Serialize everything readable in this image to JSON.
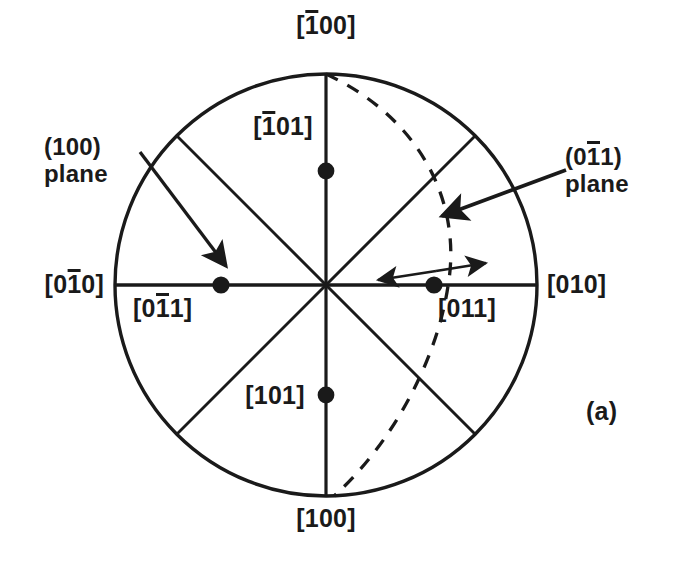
{
  "figure": {
    "kind": "stereographic-projection",
    "panel_label": "(a)",
    "background_color": "#ffffff",
    "ink_color": "#1a1a1a",
    "circle": {
      "cx": 326,
      "cy": 285,
      "r": 211
    },
    "great_circle_note": "dashed arc trace of the (01-1) plane"
  },
  "direction_labels": {
    "top": {
      "pre": "[",
      "bar": "1",
      "post": "00]"
    },
    "bottom": {
      "text": "[100]"
    },
    "left_outer": {
      "pre": "[0",
      "bar": "1",
      "post": "0]"
    },
    "right_outer": {
      "text": "[010]"
    },
    "upper_left_pole": {
      "pre": "[",
      "bar": "1",
      "post": "01]"
    },
    "lower_left_pole": {
      "text": "[101]"
    },
    "left_inner_pole": {
      "pre": "[0",
      "bar": "1",
      "post": "1]"
    },
    "right_inner_pole": {
      "text": "[011]"
    }
  },
  "annotations": {
    "plane_100": {
      "line1_pre": "(100)",
      "line2": "plane"
    },
    "plane_011": {
      "line1_pre": "(0",
      "line1_bar": "1",
      "line1_post": "1)",
      "line2": "plane"
    }
  },
  "poles": [
    {
      "name": "pole-upper",
      "x": 326,
      "y": 171
    },
    {
      "name": "pole-lower",
      "x": 326,
      "y": 395
    },
    {
      "name": "pole-left",
      "x": 221,
      "y": 285
    },
    {
      "name": "pole-right",
      "x": 434,
      "y": 285
    }
  ],
  "geometry": {
    "radial_lines": [
      {
        "name": "vertical-axis",
        "x1": 326,
        "y1": 74,
        "x2": 326,
        "y2": 496
      },
      {
        "name": "horizontal-axis",
        "x1": 115,
        "y1": 285,
        "x2": 537,
        "y2": 285
      },
      {
        "name": "diagonal-nw-se",
        "x1": 177,
        "y1": 136,
        "x2": 475,
        "y2": 434
      },
      {
        "name": "diagonal-ne-sw",
        "x1": 475,
        "y1": 136,
        "x2": 177,
        "y2": 434
      }
    ],
    "dashed_arc": {
      "name": "great-circle-trace",
      "start": [
        326,
        74
      ],
      "end": [
        326,
        496
      ],
      "bulge_x": 445
    },
    "arrow_plane_100": {
      "x1": 140,
      "y1": 152,
      "x2": 228,
      "y2": 272
    },
    "arrow_plane_011": {
      "x1": 560,
      "y1": 172,
      "x2": 438,
      "y2": 218
    },
    "double_arrow": {
      "left_tip": [
        373,
        281
      ],
      "right_tip": [
        490,
        262
      ],
      "center": [
        434,
        272
      ]
    }
  }
}
